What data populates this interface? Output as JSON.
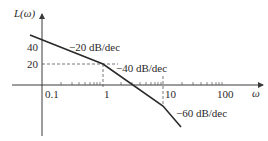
{
  "diagram": {
    "type": "bode-magnitude-asymptotic",
    "y_axis_label": "L(ω)",
    "x_axis_label": "ω",
    "y_ticks": [
      {
        "label": "40",
        "value": 40
      },
      {
        "label": "20",
        "value": 20
      }
    ],
    "x_ticks": [
      {
        "label": "0.1",
        "value": 0.1
      },
      {
        "label": "1",
        "value": 1
      },
      {
        "label": "10",
        "value": 10
      },
      {
        "label": "100",
        "value": 100
      }
    ],
    "segments": [
      {
        "slope_label": "−20 dB/dec",
        "from_omega": null,
        "to_omega": 1
      },
      {
        "slope_label": "−40 dB/dec",
        "from_omega": 1,
        "to_omega": 10
      },
      {
        "slope_label": "−60 dB/dec",
        "from_omega": 10,
        "to_omega": null
      }
    ],
    "break_points": [
      {
        "omega": 1,
        "magnitude_db": 20
      },
      {
        "omega": 10,
        "magnitude_db": -20
      }
    ],
    "colors": {
      "curve": "#2a2a2a",
      "axis": "#3a3a3a",
      "background": "#ffffff"
    }
  }
}
